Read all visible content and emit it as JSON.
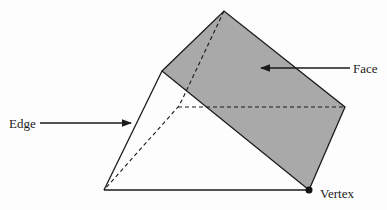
{
  "diagram": {
    "type": "triangular-prism",
    "labels": {
      "face": "Face",
      "edge": "Edge",
      "vertex": "Vertex"
    },
    "colors": {
      "face_fill": "#a9a9a9",
      "stroke": "#1a1a1a"
    }
  }
}
